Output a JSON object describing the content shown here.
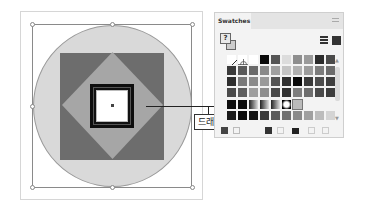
{
  "canvas": {
    "drag_label": "드래그",
    "colors": {
      "circle_fill": "#d9d9d9",
      "square_fill": "#6d6d6d",
      "diamond_fill": "#a6a6a6",
      "frame_fill": "#0e0e0e",
      "inner_fill": "#ffffff"
    }
  },
  "swatches_panel": {
    "tab_label": "Swatches",
    "fill_stroke_label": "?",
    "view_list_label": "list-view",
    "view_grid_label": "grid-view",
    "rows": [
      [
        "none",
        "registration",
        "#ffffff",
        "#0a0a0a",
        "#555555",
        "#dcdcdc",
        "#8e8e8e",
        "#9a9a9a",
        "#2b2b2b",
        "#4a4a4a"
      ],
      [
        "#3a3a3a",
        "#5a5a5a",
        "#6a6a6a",
        "#8a8a8a",
        "#a0a0a0",
        "#c4c4c4",
        "#b0b0b0",
        "#9c9c9c",
        "#7c7c7c",
        "#6c6c6c"
      ],
      [
        "#2e2e2e",
        "#7a7a7a",
        "#8a8a8a",
        "#9a9a9a",
        "#555555",
        "#303030",
        "#0a0a0a",
        "#3a3a3a",
        "#4c4c4c",
        "#3e3e3e"
      ],
      [
        "#4a4a4a",
        "#5e5e5e",
        "#9e9e9e",
        "#8e8e8e",
        "#4a4a4a",
        "#303030",
        "#7e7e7e",
        "#6e6e6e",
        "#4a4a4a",
        "#3c3c3c"
      ],
      [
        "#0e0e0e",
        "#0c0c0c",
        "gradient",
        "gradient",
        "gradient",
        "radial",
        "pattern",
        "",
        "",
        ""
      ],
      [
        "#1a1a1a",
        "#0a0a0a",
        "#141414",
        "#3a3a3a",
        "#5a5a5a",
        "#707070",
        "#8a8a8a",
        "#a0a0a0",
        "#bcbcbc",
        "#d4d4d4"
      ]
    ],
    "bottom_icons": [
      "swatch-libraries-icon",
      "show-kinds-icon",
      "swatch-options-icon",
      "new-color-group-icon",
      "folder-icon",
      "new-swatch-icon",
      "delete-icon"
    ]
  }
}
